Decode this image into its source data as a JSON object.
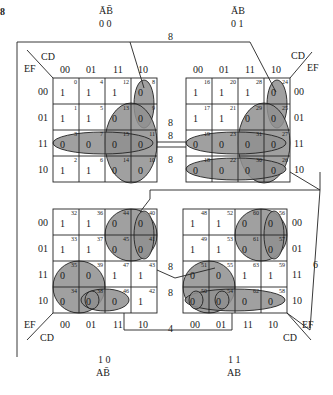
{
  "figure": {
    "label": "8"
  },
  "quadrants": {
    "tl": {
      "ab_bar_label": "ĀB̄",
      "ab_code": "0 0",
      "cd_label": "CD",
      "ef_label": "EF",
      "col_codes": [
        "00",
        "01",
        "11",
        "10"
      ],
      "row_codes": [
        "00",
        "01",
        "11",
        "10"
      ],
      "cells": [
        [
          {
            "i": "0",
            "v": "1"
          },
          {
            "i": "4",
            "v": "1"
          },
          {
            "i": "12",
            "v": "1"
          },
          {
            "i": "8",
            "v": "0"
          }
        ],
        [
          {
            "i": "1",
            "v": "1"
          },
          {
            "i": "5",
            "v": "1"
          },
          {
            "i": "13",
            "v": "0"
          },
          {
            "i": "9",
            "v": "0"
          }
        ],
        [
          {
            "i": "3",
            "v": "0"
          },
          {
            "i": "7",
            "v": "0"
          },
          {
            "i": "15",
            "v": "0"
          },
          {
            "i": "11",
            "v": "0"
          }
        ],
        [
          {
            "i": "2",
            "v": "1"
          },
          {
            "i": "6",
            "v": "1"
          },
          {
            "i": "14",
            "v": "0"
          },
          {
            "i": "10",
            "v": "0"
          }
        ]
      ]
    },
    "tr": {
      "ab_bar_label": "ĀB",
      "ab_code": "0 1",
      "cd_label": "CD",
      "ef_label": "EF",
      "col_codes": [
        "00",
        "01",
        "11",
        "10"
      ],
      "row_codes": [
        "00",
        "01",
        "11",
        "10"
      ],
      "cells": [
        [
          {
            "i": "16",
            "v": "1"
          },
          {
            "i": "20",
            "v": "1"
          },
          {
            "i": "28",
            "v": "1"
          },
          {
            "i": "24",
            "v": "0"
          }
        ],
        [
          {
            "i": "17",
            "v": "1"
          },
          {
            "i": "21",
            "v": "1"
          },
          {
            "i": "29",
            "v": "0"
          },
          {
            "i": "25",
            "v": "0"
          }
        ],
        [
          {
            "i": "19",
            "v": "0"
          },
          {
            "i": "23",
            "v": "0"
          },
          {
            "i": "31",
            "v": "0"
          },
          {
            "i": "27",
            "v": "0"
          }
        ],
        [
          {
            "i": "18",
            "v": "0"
          },
          {
            "i": "22",
            "v": "0"
          },
          {
            "i": "30",
            "v": "0"
          },
          {
            "i": "26",
            "v": "0"
          }
        ]
      ]
    },
    "bl": {
      "ab_bar_label": "AB̄",
      "ab_code": "1 0",
      "cd_label": "CD",
      "ef_label": "EF",
      "col_codes": [
        "00",
        "01",
        "11",
        "10"
      ],
      "row_codes": [
        "00",
        "01",
        "11",
        "10"
      ],
      "cells": [
        [
          {
            "i": "32",
            "v": "1"
          },
          {
            "i": "36",
            "v": "1"
          },
          {
            "i": "44",
            "v": "0"
          },
          {
            "i": "40",
            "v": "0"
          }
        ],
        [
          {
            "i": "33",
            "v": "1"
          },
          {
            "i": "37",
            "v": "1"
          },
          {
            "i": "45",
            "v": "0"
          },
          {
            "i": "41",
            "v": "0"
          }
        ],
        [
          {
            "i": "35",
            "v": "0"
          },
          {
            "i": "39",
            "v": "0"
          },
          {
            "i": "47",
            "v": "1"
          },
          {
            "i": "43",
            "v": "1"
          }
        ],
        [
          {
            "i": "34",
            "v": "0"
          },
          {
            "i": "38",
            "v": "0"
          },
          {
            "i": "46",
            "v": "0"
          },
          {
            "i": "42",
            "v": "1"
          }
        ]
      ]
    },
    "br": {
      "ab_bar_label": "AB",
      "ab_code": "1 1",
      "cd_label": "CD",
      "ef_label": "EF",
      "col_codes": [
        "00",
        "01",
        "11",
        "10"
      ],
      "row_codes": [
        "00",
        "01",
        "11",
        "10"
      ],
      "cells": [
        [
          {
            "i": "48",
            "v": "1"
          },
          {
            "i": "52",
            "v": "1"
          },
          {
            "i": "60",
            "v": "0"
          },
          {
            "i": "56",
            "v": "0"
          }
        ],
        [
          {
            "i": "49",
            "v": "1"
          },
          {
            "i": "53",
            "v": "1"
          },
          {
            "i": "61",
            "v": "0"
          },
          {
            "i": "57",
            "v": "0"
          }
        ],
        [
          {
            "i": "51",
            "v": "0"
          },
          {
            "i": "55",
            "v": "0"
          },
          {
            "i": "63",
            "v": "1"
          },
          {
            "i": "59",
            "v": "1"
          }
        ],
        [
          {
            "i": "50",
            "v": "0"
          },
          {
            "i": "54",
            "v": "0"
          },
          {
            "i": "62",
            "v": "0"
          },
          {
            "i": "58",
            "v": "0"
          }
        ]
      ]
    }
  },
  "group_sizes": {
    "top_link": "8",
    "mid_row1": "8",
    "mid_row2": "8",
    "mid_row3": "8",
    "bottom_mid1": "8",
    "bottom_mid2": "8",
    "bottom_link": "4",
    "right_link": "6"
  },
  "colors": {
    "loop_fill": "#8f8f8f",
    "line": "#222222"
  }
}
